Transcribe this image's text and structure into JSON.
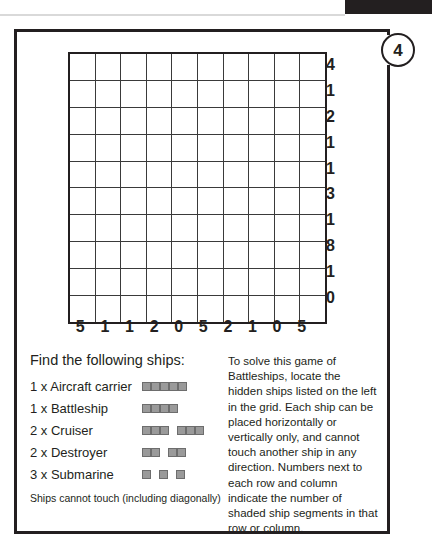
{
  "puzzle": {
    "number": "4",
    "type": "Battleships"
  },
  "grid": {
    "rows": 10,
    "cols": 10,
    "row_clues": [
      4,
      1,
      2,
      1,
      1,
      3,
      1,
      8,
      1,
      0
    ],
    "col_clues": [
      5,
      1,
      1,
      2,
      0,
      5,
      2,
      1,
      0,
      5
    ],
    "cells": [
      [
        "",
        "",
        "",
        "",
        "",
        "",
        "",
        "",
        "",
        ""
      ],
      [
        "",
        "",
        "",
        "",
        "",
        "",
        "",
        "",
        "",
        ""
      ],
      [
        "",
        "",
        "",
        "",
        "",
        "",
        "",
        "",
        "",
        ""
      ],
      [
        "",
        "",
        "",
        "",
        "",
        "",
        "",
        "",
        "",
        ""
      ],
      [
        "",
        "",
        "",
        "",
        "",
        "",
        "",
        "",
        "",
        ""
      ],
      [
        "",
        "",
        "",
        "",
        "",
        "",
        "",
        "",
        "",
        ""
      ],
      [
        "",
        "",
        "",
        "",
        "",
        "",
        "",
        "",
        "",
        ""
      ],
      [
        "",
        "",
        "",
        "",
        "",
        "",
        "",
        "",
        "",
        ""
      ],
      [
        "",
        "",
        "",
        "",
        "",
        "",
        "",
        "",
        "",
        ""
      ],
      [
        "",
        "",
        "",
        "",
        "",
        "",
        "",
        "",
        "",
        ""
      ]
    ]
  },
  "ships_panel": {
    "title": "Find the following ships:",
    "items": [
      {
        "label": "1 x Aircraft carrier",
        "count": 1,
        "length": 5
      },
      {
        "label": "1 x Battleship",
        "count": 1,
        "length": 4
      },
      {
        "label": "2 x Cruiser",
        "count": 2,
        "length": 3
      },
      {
        "label": "2 x Destroyer",
        "count": 2,
        "length": 2
      },
      {
        "label": "3 x Submarine",
        "count": 3,
        "length": 1
      }
    ],
    "note": "Ships cannot touch (including diagonally)"
  },
  "rules_panel": {
    "text": "To solve this game of Battleships, locate the hidden ships listed on the left in the grid. Each ship can be placed horizontally or vertically only, and cannot touch another ship in any direction. Numbers next to each row and column indicate the number of shaded ship segments in that row or column."
  },
  "colors": {
    "ink": "#231f20",
    "grid_line": "#3a3a3a",
    "ship_fill": "#9a9a9a",
    "ship_stroke": "#6d6d6d",
    "header_bar": "#231f20"
  }
}
